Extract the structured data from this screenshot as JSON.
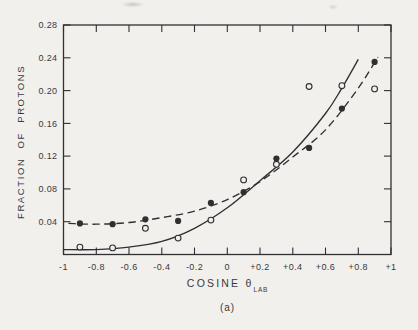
{
  "figure": {
    "caption": "(a)"
  },
  "chart_data": {
    "type": "scatter",
    "title": "",
    "xlabel": "COSINE θ_LAB",
    "xlabel_main": "COSINE θ",
    "xlabel_sub": "LAB",
    "ylabel": "FRACTION OF PROTONS",
    "xlim": [
      -1,
      1
    ],
    "ylim": [
      0,
      0.28
    ],
    "grid": false,
    "legend": "none",
    "x_ticks": [
      {
        "value": -1,
        "label": "-1"
      },
      {
        "value": -0.8,
        "label": "-0.8"
      },
      {
        "value": -0.6,
        "label": "-0.6"
      },
      {
        "value": -0.4,
        "label": "-0.4"
      },
      {
        "value": -0.2,
        "label": "-0.2"
      },
      {
        "value": 0,
        "label": "0"
      },
      {
        "value": 0.2,
        "label": "+0.2"
      },
      {
        "value": 0.4,
        "label": "+0.4"
      },
      {
        "value": 0.6,
        "label": "+0.6"
      },
      {
        "value": 0.8,
        "label": "+0.8"
      },
      {
        "value": 1,
        "label": "+1"
      }
    ],
    "y_ticks": [
      {
        "value": 0.04,
        "label": "0.04"
      },
      {
        "value": 0.08,
        "label": "0.08"
      },
      {
        "value": 0.12,
        "label": "0.12"
      },
      {
        "value": 0.16,
        "label": "0.16"
      },
      {
        "value": 0.2,
        "label": "0.20"
      },
      {
        "value": 0.24,
        "label": "0.24"
      },
      {
        "value": 0.28,
        "label": "0.28"
      }
    ],
    "series": [
      {
        "name": "dashed-curve",
        "kind": "curve",
        "style": "dashed",
        "points": [
          [
            -0.97,
            0.038
          ],
          [
            -0.8,
            0.037
          ],
          [
            -0.6,
            0.039
          ],
          [
            -0.4,
            0.045
          ],
          [
            -0.2,
            0.053
          ],
          [
            0,
            0.067
          ],
          [
            0.2,
            0.089
          ],
          [
            0.4,
            0.119
          ],
          [
            0.6,
            0.152
          ],
          [
            0.8,
            0.203
          ],
          [
            0.92,
            0.241
          ]
        ]
      },
      {
        "name": "solid-curve",
        "kind": "curve",
        "style": "solid",
        "points": [
          [
            -1,
            0.006
          ],
          [
            -0.8,
            0.006
          ],
          [
            -0.6,
            0.009
          ],
          [
            -0.4,
            0.016
          ],
          [
            -0.2,
            0.032
          ],
          [
            0,
            0.057
          ],
          [
            0.2,
            0.09
          ],
          [
            0.4,
            0.125
          ],
          [
            0.6,
            0.172
          ],
          [
            0.7,
            0.203
          ],
          [
            0.8,
            0.238
          ]
        ]
      },
      {
        "name": "filled-circle-points",
        "kind": "markers",
        "marker": "filled-circle",
        "points": [
          [
            -0.9,
            0.038
          ],
          [
            -0.7,
            0.037
          ],
          [
            -0.5,
            0.043
          ],
          [
            -0.3,
            0.041
          ],
          [
            -0.1,
            0.063
          ],
          [
            0.1,
            0.076
          ],
          [
            0.3,
            0.117
          ],
          [
            0.5,
            0.13
          ],
          [
            0.7,
            0.178
          ],
          [
            0.9,
            0.235
          ]
        ]
      },
      {
        "name": "open-circle-points",
        "kind": "markers",
        "marker": "open-circle",
        "points": [
          [
            -0.9,
            0.009
          ],
          [
            -0.7,
            0.008
          ],
          [
            -0.5,
            0.032
          ],
          [
            -0.3,
            0.02
          ],
          [
            -0.1,
            0.042
          ],
          [
            0.1,
            0.091
          ],
          [
            0.3,
            0.11
          ],
          [
            0.5,
            0.205
          ],
          [
            0.7,
            0.206
          ],
          [
            0.9,
            0.202
          ]
        ]
      }
    ],
    "colors": {
      "ink": "#303032",
      "paper": "#f1f0ec"
    }
  }
}
